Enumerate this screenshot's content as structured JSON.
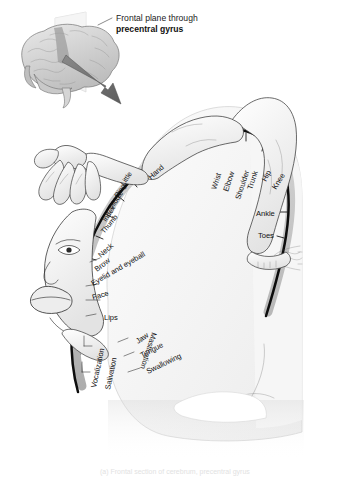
{
  "figure": {
    "title_line1": "Frontal plane through",
    "title_line2": "precentral gyrus",
    "caption": "(a) Frontal section of cerebrum, precentral gyrus",
    "colors": {
      "gyrus_line": "#0d0d0d",
      "cortex_band": "#b9b9b9",
      "brain_fill": "#f3f3f3",
      "arrow": "#6f6f6f",
      "plane": "#efefef",
      "label_text": "#111111"
    }
  },
  "inset": {
    "name": "lateral-brain-with-frontal-plane",
    "arrow_name": "section-direction-arrow",
    "plane_name": "frontal-plane-sheet"
  },
  "homunculus": {
    "name": "motor-homunculus",
    "labels": [
      {
        "text": "Hand",
        "rotate": -42
      },
      {
        "text": "Little",
        "rotate": -56
      },
      {
        "text": "Ring",
        "rotate": -56
      },
      {
        "text": "Middle",
        "rotate": -56
      },
      {
        "text": "Index",
        "rotate": -56
      },
      {
        "text": "Thumb",
        "rotate": -50
      },
      {
        "text": "Neck",
        "rotate": -42
      },
      {
        "text": "Brow",
        "rotate": -38
      },
      {
        "text": "Eyelid and eyeball",
        "rotate": -30
      },
      {
        "text": "Face",
        "rotate": -16
      },
      {
        "text": "Lips",
        "rotate": 0
      },
      {
        "text": "Vocalization",
        "rotate": -78
      },
      {
        "text": "Salivation",
        "rotate": -78
      },
      {
        "text": "Mastication",
        "rotate": 108
      },
      {
        "text": "Jaw",
        "rotate": -34
      },
      {
        "text": "Tongue",
        "rotate": -28
      },
      {
        "text": "Swallowing",
        "rotate": -26
      },
      {
        "text": "Wrist",
        "rotate": -72
      },
      {
        "text": "Elbow",
        "rotate": -72
      },
      {
        "text": "Shoulder",
        "rotate": -72
      },
      {
        "text": "Trunk",
        "rotate": -72
      },
      {
        "text": "Hip",
        "rotate": -62
      },
      {
        "text": "Knee",
        "rotate": -58
      },
      {
        "text": "Ankle",
        "rotate": 0
      },
      {
        "text": "Toes",
        "rotate": 0
      }
    ]
  }
}
